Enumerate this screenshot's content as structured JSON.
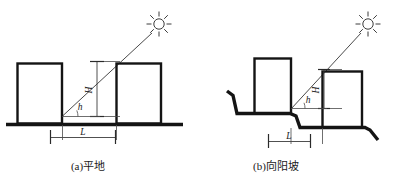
{
  "figure": {
    "title": "",
    "background_color": "#ffffff",
    "line_color": "#141414",
    "ray_color": "#4a4a4a",
    "panels": [
      {
        "id": "a",
        "caption": "(a)平地",
        "caption_x": 88,
        "caption_y": 168,
        "terrain": "flat",
        "labels": {
          "height": "H",
          "angle": "h",
          "spacing": "L"
        },
        "icons": {
          "sun": "sun-icon"
        },
        "buildings": [
          {
            "name": "front-building",
            "x": 17,
            "y": 63,
            "w": 45,
            "h": 60
          },
          {
            "name": "rear-building",
            "x": 116,
            "y": 63,
            "w": 45,
            "h": 60
          }
        ],
        "ground_y": 124,
        "ground_x1": 6,
        "ground_x2": 183,
        "sun_center_x": 159,
        "sun_center_y": 24,
        "ray_x1": 62,
        "ray_y1": 116,
        "ray_x2": 150,
        "ray_y2": 35,
        "dim_vertical_x": 97,
        "dim_vertical_y1": 61,
        "dim_vertical_y2": 116,
        "dim_spacing_y": 137,
        "dim_spacing_x1": 50,
        "dim_spacing_x2": 115
      },
      {
        "id": "b",
        "caption": "(b)向阳坡",
        "caption_x": 272,
        "caption_y": 168,
        "terrain": "sunny-slope",
        "labels": {
          "height": "H",
          "angle": "h",
          "spacing": "L"
        },
        "icons": {
          "sun": "sun-icon"
        },
        "buildings": [
          {
            "name": "front-building",
            "x": 254,
            "y": 58,
            "w": 37,
            "h": 56
          },
          {
            "name": "rear-building",
            "x": 322,
            "y": 71,
            "w": 40,
            "h": 56
          }
        ],
        "ground_points": "227,91 233,95 237,113 290,113 296,116 300,127 365,127 370,129 378,140",
        "sun_center_x": 368,
        "sun_center_y": 24,
        "ray_x1": 291,
        "ray_y1": 108,
        "ray_x2": 358,
        "ray_y2": 35,
        "dim_vertical_x": 324,
        "dim_vertical_y1": 70,
        "dim_vertical_y2": 107,
        "dim_spacing_y": 141,
        "dim_spacing_x1": 268,
        "dim_spacing_x2": 310
      }
    ]
  }
}
